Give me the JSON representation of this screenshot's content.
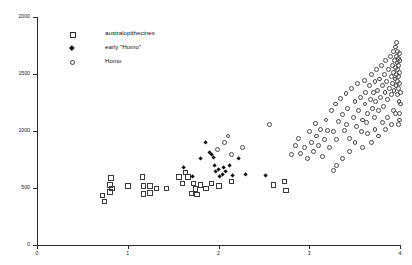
{
  "chart_data": {
    "type": "scatter",
    "title": "",
    "xlabel": "",
    "ylabel": "",
    "xlim": [
      0,
      4
    ],
    "ylim": [
      0,
      2000
    ],
    "grid": false,
    "legend_position": "top-left",
    "yticks": [
      0,
      500,
      1000,
      1500,
      2000
    ],
    "ytick_labels": [
      "0",
      "500",
      "1000",
      "1500",
      "2000"
    ],
    "xticks": [
      0,
      1,
      2,
      3,
      4
    ],
    "xtick_labels": [
      "0",
      "1",
      "2",
      "3",
      "4"
    ],
    "series": [
      {
        "name": "australopithecines",
        "marker": "open-square",
        "color": "#3a3a3a",
        "points": [
          [
            0.72,
            440
          ],
          [
            0.74,
            385
          ],
          [
            0.8,
            530
          ],
          [
            0.8,
            470
          ],
          [
            0.81,
            590
          ],
          [
            0.82,
            500
          ],
          [
            1.0,
            520
          ],
          [
            1.16,
            600
          ],
          [
            1.17,
            520
          ],
          [
            1.17,
            450
          ],
          [
            1.24,
            520
          ],
          [
            1.24,
            460
          ],
          [
            1.31,
            500
          ],
          [
            1.42,
            500
          ],
          [
            1.56,
            600
          ],
          [
            1.6,
            545
          ],
          [
            1.63,
            640
          ],
          [
            1.66,
            600
          ],
          [
            1.7,
            455
          ],
          [
            1.72,
            545
          ],
          [
            1.74,
            495
          ],
          [
            1.76,
            445
          ],
          [
            1.8,
            530
          ],
          [
            1.86,
            500
          ],
          [
            1.92,
            545
          ],
          [
            2.0,
            520
          ],
          [
            2.14,
            560
          ],
          [
            2.6,
            530
          ],
          [
            2.72,
            560
          ],
          [
            2.74,
            480
          ]
        ]
      },
      {
        "name": "early \"Homo\"",
        "marker": "filled-diamond",
        "color": "#111111",
        "points": [
          [
            1.62,
            680
          ],
          [
            1.72,
            600
          ],
          [
            1.8,
            760
          ],
          [
            1.86,
            900
          ],
          [
            1.9,
            810
          ],
          [
            1.92,
            790
          ],
          [
            1.95,
            770
          ],
          [
            1.96,
            700
          ],
          [
            1.97,
            640
          ],
          [
            2.0,
            660
          ],
          [
            2.01,
            600
          ],
          [
            2.04,
            620
          ],
          [
            2.06,
            680
          ],
          [
            2.08,
            640
          ],
          [
            2.12,
            700
          ],
          [
            2.16,
            610
          ],
          [
            2.22,
            760
          ],
          [
            2.3,
            620
          ],
          [
            2.52,
            610
          ]
        ]
      },
      {
        "name": "Homo",
        "marker": "open-circle",
        "color": "#4a4a4a",
        "points": [
          [
            1.98,
            840
          ],
          [
            2.06,
            900
          ],
          [
            2.1,
            960
          ],
          [
            2.14,
            800
          ],
          [
            2.26,
            860
          ],
          [
            2.56,
            1060
          ],
          [
            2.8,
            800
          ],
          [
            2.84,
            880
          ],
          [
            2.88,
            940
          ],
          [
            2.9,
            810
          ],
          [
            2.94,
            860
          ],
          [
            2.98,
            760
          ],
          [
            3.0,
            1000
          ],
          [
            3.02,
            900
          ],
          [
            3.04,
            820
          ],
          [
            3.06,
            1070
          ],
          [
            3.08,
            960
          ],
          [
            3.1,
            880
          ],
          [
            3.12,
            1020
          ],
          [
            3.14,
            780
          ],
          [
            3.16,
            930
          ],
          [
            3.18,
            1100
          ],
          [
            3.2,
            1010
          ],
          [
            3.22,
            860
          ],
          [
            3.24,
            1180
          ],
          [
            3.26,
            1000
          ],
          [
            3.28,
            1240
          ],
          [
            3.3,
            930
          ],
          [
            3.32,
            1090
          ],
          [
            3.34,
            1290
          ],
          [
            3.36,
            1150
          ],
          [
            3.38,
            1010
          ],
          [
            3.4,
            1330
          ],
          [
            3.41,
            1060
          ],
          [
            3.42,
            1200
          ],
          [
            3.44,
            940
          ],
          [
            3.46,
            1380
          ],
          [
            3.48,
            1120
          ],
          [
            3.5,
            1260
          ],
          [
            3.52,
            1040
          ],
          [
            3.53,
            1420
          ],
          [
            3.54,
            1180
          ],
          [
            3.56,
            1300
          ],
          [
            3.57,
            1000
          ],
          [
            3.58,
            1100
          ],
          [
            3.6,
            1450
          ],
          [
            3.61,
            1240
          ],
          [
            3.62,
            1340
          ],
          [
            3.63,
            1080
          ],
          [
            3.64,
            1160
          ],
          [
            3.66,
            1400
          ],
          [
            3.67,
            1280
          ],
          [
            3.68,
            1500
          ],
          [
            3.69,
            1200
          ],
          [
            3.7,
            1340
          ],
          [
            3.71,
            1120
          ],
          [
            3.72,
            1440
          ],
          [
            3.73,
            1260
          ],
          [
            3.74,
            1540
          ],
          [
            3.75,
            1360
          ],
          [
            3.76,
            1180
          ],
          [
            3.77,
            1460
          ],
          [
            3.78,
            1300
          ],
          [
            3.79,
            1580
          ],
          [
            3.8,
            1400
          ],
          [
            3.81,
            1220
          ],
          [
            3.82,
            1500
          ],
          [
            3.83,
            1340
          ],
          [
            3.84,
            1620
          ],
          [
            3.85,
            1440
          ],
          [
            3.86,
            1280
          ],
          [
            3.87,
            1540
          ],
          [
            3.88,
            1380
          ],
          [
            3.89,
            1660
          ],
          [
            3.9,
            1480
          ],
          [
            3.905,
            1320
          ],
          [
            3.91,
            1580
          ],
          [
            3.915,
            1420
          ],
          [
            3.92,
            1700
          ],
          [
            3.925,
            1520
          ],
          [
            3.93,
            1360
          ],
          [
            3.935,
            1620
          ],
          [
            3.94,
            1460
          ],
          [
            3.945,
            1740
          ],
          [
            3.95,
            1560
          ],
          [
            3.952,
            1400
          ],
          [
            3.955,
            1660
          ],
          [
            3.958,
            1500
          ],
          [
            3.96,
            1780
          ],
          [
            3.962,
            1600
          ],
          [
            3.965,
            1440
          ],
          [
            3.968,
            1700
          ],
          [
            3.97,
            1540
          ],
          [
            3.972,
            1320
          ],
          [
            3.975,
            1640
          ],
          [
            3.978,
            1480
          ],
          [
            3.98,
            1380
          ],
          [
            3.982,
            1580
          ],
          [
            3.985,
            1260
          ],
          [
            3.988,
            1680
          ],
          [
            3.99,
            1420
          ],
          [
            3.992,
            1520
          ],
          [
            3.994,
            1160
          ],
          [
            3.996,
            1620
          ],
          [
            3.998,
            1340
          ],
          [
            4.0,
            1240
          ],
          [
            3.986,
            1100
          ],
          [
            3.976,
            1060
          ],
          [
            3.944,
            1160
          ],
          [
            3.92,
            1180
          ],
          [
            3.9,
            1060
          ],
          [
            3.86,
            1120
          ],
          [
            3.84,
            1020
          ],
          [
            3.8,
            1080
          ],
          [
            3.76,
            960
          ],
          [
            3.72,
            1020
          ],
          [
            3.68,
            900
          ],
          [
            3.64,
            980
          ],
          [
            3.58,
            860
          ],
          [
            3.5,
            900
          ],
          [
            3.44,
            820
          ],
          [
            3.36,
            760
          ],
          [
            3.3,
            700
          ],
          [
            3.26,
            660
          ]
        ]
      }
    ]
  },
  "legend": {
    "items": [
      {
        "label": "australopithecines",
        "marker": "open-square"
      },
      {
        "label": "early \"Homo\"",
        "marker": "filled-diamond"
      },
      {
        "label": "Homo",
        "marker": "open-circle"
      }
    ]
  }
}
